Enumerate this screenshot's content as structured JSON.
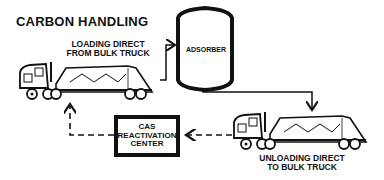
{
  "title": "CARBON HANDLING",
  "nodes": {
    "loading_truck": {
      "label_line1": "LOADING DIRECT",
      "label_line2": "FROM BULK TRUCK"
    },
    "adsorber": {
      "label": "ADSORBER"
    },
    "unloading_truck": {
      "label_line1": "UNLOADING DIRECT",
      "label_line2": "TO BULK TRUCK"
    },
    "reactivation": {
      "line1": "CAS",
      "line2": "REACTIVATION",
      "line3": "CENTER"
    }
  },
  "edges": [
    {
      "from": "loading_truck",
      "to": "adsorber",
      "style": "solid"
    },
    {
      "from": "adsorber",
      "to": "unloading_truck",
      "style": "solid"
    },
    {
      "from": "unloading_truck",
      "to": "reactivation",
      "style": "dashed"
    },
    {
      "from": "reactivation",
      "to": "loading_truck",
      "style": "dashed"
    }
  ],
  "colors": {
    "ink": "#111111",
    "background": "#ffffff"
  }
}
